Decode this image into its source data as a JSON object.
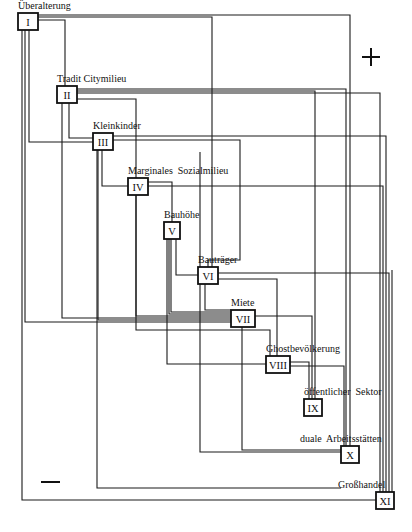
{
  "diagram": {
    "signs": {
      "plus": "+",
      "minus": "−"
    },
    "nodes": [
      {
        "id": "I",
        "label": "Überalterung",
        "x": 18,
        "y": 13,
        "w": 20,
        "h": 17,
        "lx": 18,
        "ly": 10
      },
      {
        "id": "II",
        "label": "Tradit Citymilieu",
        "x": 57,
        "y": 86,
        "w": 20,
        "h": 17,
        "lx": 57,
        "ly": 83
      },
      {
        "id": "III",
        "label": "Kleinkinder",
        "x": 93,
        "y": 133,
        "w": 20,
        "h": 17,
        "lx": 93,
        "ly": 130
      },
      {
        "id": "IV",
        "label": "Marginales  Sozialmilieu",
        "x": 128,
        "y": 178,
        "w": 20,
        "h": 17,
        "lx": 128,
        "ly": 175
      },
      {
        "id": "V",
        "label": "Bauhöhe",
        "x": 164,
        "y": 222,
        "w": 16,
        "h": 17,
        "lx": 164,
        "ly": 219
      },
      {
        "id": "VI",
        "label": "Bauträger",
        "x": 198,
        "y": 267,
        "w": 20,
        "h": 17,
        "lx": 198,
        "ly": 264
      },
      {
        "id": "VII",
        "label": "Miete",
        "x": 231,
        "y": 310,
        "w": 24,
        "h": 17,
        "lx": 231,
        "ly": 307
      },
      {
        "id": "VIII",
        "label": "Ghostbevölkerung",
        "x": 266,
        "y": 356,
        "w": 24,
        "h": 17,
        "lx": 266,
        "ly": 353
      },
      {
        "id": "IX",
        "label": "öffentlicher  Sektor",
        "x": 304,
        "y": 399,
        "w": 18,
        "h": 17,
        "lx": 304,
        "ly": 396
      },
      {
        "id": "X",
        "label": "duale  Arbeitsstätten",
        "x": 341,
        "y": 446,
        "w": 18,
        "h": 17,
        "lx": 300,
        "ly": 443
      },
      {
        "id": "XI",
        "label": "Großhandel",
        "x": 376,
        "y": 492,
        "w": 18,
        "h": 17,
        "lx": 338,
        "ly": 489
      }
    ],
    "edges": [
      {
        "from": "I",
        "to": "II",
        "points": "38,20 65,20 65,86"
      },
      {
        "from": "I",
        "to": "III",
        "points": "29,30 29,142 93,142"
      },
      {
        "from": "I",
        "to": "VII",
        "points": "25,30 25,322 231,322"
      },
      {
        "from": "I",
        "to": "XI",
        "points": "22,30 22,500 376,500"
      },
      {
        "from": "I",
        "to": "VI",
        "points": "38,17 212,17 212,267"
      },
      {
        "from": "I",
        "to": "X",
        "points": "38,15 350,15 350,446"
      },
      {
        "from": "II",
        "to": "VII",
        "points": "62,103 62,318 231,318"
      },
      {
        "from": "II",
        "to": "III",
        "points": "69,103 69,138 93,138"
      },
      {
        "from": "II",
        "to": "VIII",
        "points": "77,99 136,99 136,330 270,330 270,356"
      },
      {
        "from": "II",
        "to": "IX",
        "points": "77,91 315,91 315,399"
      },
      {
        "from": "II",
        "to": "X",
        "points": "77,89 346,89 346,446"
      },
      {
        "from": "II",
        "to": "XI",
        "points": "77,93 380,93 380,492"
      },
      {
        "from": "III",
        "to": "IV",
        "points": "102,150 102,186 128,186"
      },
      {
        "from": "III",
        "to": "VII",
        "points": "98,150 98,320 231,320"
      },
      {
        "from": "III",
        "to": "X",
        "points": "97,150 97,488 341,488"
      },
      {
        "from": "III",
        "to": "XI",
        "points": "113,136 386,136 386,492"
      },
      {
        "from": "III",
        "to": "VI",
        "points": "113,140 240,140 240,260 208,260 208,267"
      },
      {
        "from": "IV",
        "to": "V",
        "points": "148,182 172,182 172,222"
      },
      {
        "from": "IV",
        "to": "VII",
        "points": "136,195 136,316 231,316"
      },
      {
        "from": "IV",
        "to": "XI",
        "points": "148,186 383,186 383,492"
      },
      {
        "from": "V",
        "to": "VII",
        "points": "169,239 169,314 231,314"
      },
      {
        "from": "V",
        "to": "VII",
        "points": "171,239 171,312 231,312"
      },
      {
        "from": "V",
        "to": "VI",
        "points": "176,239 176,275 198,275"
      },
      {
        "from": "V",
        "to": "VIII",
        "points": "167,239 167,364 266,364"
      },
      {
        "from": "VI",
        "to": "VII",
        "points": "205,284 205,310 231,310"
      },
      {
        "from": "VI",
        "to": "XI",
        "points": "218,273 389,273 389,492"
      },
      {
        "from": "VI",
        "to": "VIII",
        "points": "218,279 277,279 277,356"
      },
      {
        "from": "VII",
        "to": "X",
        "points": "242,327 242,450 341,450"
      },
      {
        "from": "VII",
        "to": "IX",
        "points": "255,316 312,316 312,399"
      },
      {
        "from": "VIII",
        "to": "IX",
        "points": "290,362 309,362 309,399"
      },
      {
        "from": "VIII",
        "to": "X",
        "points": "290,366 344,366 344,446"
      },
      {
        "from": "II",
        "to": "X",
        "points": "200,152 200,452 341,452"
      },
      {
        "from": "XI",
        "to": "XI",
        "points": "392,270 392,492"
      }
    ]
  }
}
